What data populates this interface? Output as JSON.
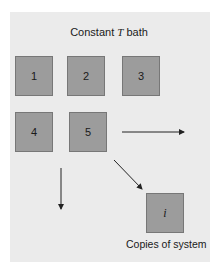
{
  "diagram": {
    "title_prefix": "Constant ",
    "title_variable": "T",
    "title_suffix": " bath",
    "boxes": [
      {
        "label": "1"
      },
      {
        "label": "2"
      },
      {
        "label": "3"
      },
      {
        "label": "4"
      },
      {
        "label": "5"
      },
      {
        "label": "i"
      }
    ],
    "caption": "Copies of system",
    "colors": {
      "background": "#ebebeb",
      "box_fill": "#9c9c9c",
      "box_border": "#777777",
      "arrow": "#222222"
    }
  }
}
